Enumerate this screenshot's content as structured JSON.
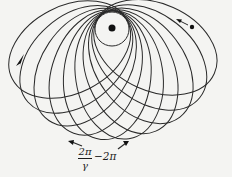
{
  "diagram": {
    "center": {
      "x": 112,
      "y": 28
    },
    "core_circle_radius": 17,
    "nucleus_dot_radius": 3.5,
    "ellipse": {
      "perihelion": 17,
      "aphelion": 112,
      "count": 10,
      "angle_start_deg": 153,
      "angle_end_deg": 24
    },
    "stroke_color": "#2a2a2a",
    "labels": {
      "fraction_numerator": "2π",
      "fraction_denominator": "γ",
      "minus_term": "−2π"
    },
    "markers": [
      {
        "name": "orbit-body-dot",
        "x": 192,
        "y": 27
      },
      {
        "name": "left-arrowhead",
        "x": 17,
        "y": 65
      }
    ]
  }
}
